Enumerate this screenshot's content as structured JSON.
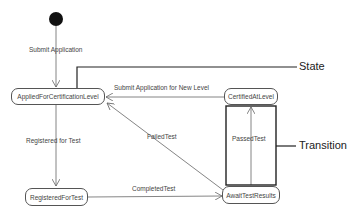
{
  "diagram": {
    "type": "UML state machine",
    "initial_state": "initial-node",
    "states": [
      {
        "id": "applied",
        "label": "AppliedForCertificationLevel"
      },
      {
        "id": "certified",
        "label": "CertifiedAtLevel"
      },
      {
        "id": "registered",
        "label": "RegisteredForTest"
      },
      {
        "id": "await",
        "label": "AwaitTestResults"
      }
    ],
    "transitions": [
      {
        "from": "initial",
        "to": "applied",
        "label": "Submit Application"
      },
      {
        "from": "certified",
        "to": "applied",
        "label": "Submit Application for New Level"
      },
      {
        "from": "applied",
        "to": "registered",
        "label": "Registered for Test"
      },
      {
        "from": "await",
        "to": "applied",
        "label": "FailedTest"
      },
      {
        "from": "registered",
        "to": "await",
        "label": "CompletedTest"
      },
      {
        "from": "await",
        "to": "certified",
        "label": "PassedTest"
      }
    ],
    "callouts": {
      "state": "State",
      "transition": "Transition"
    },
    "colors": {
      "line": "#666666",
      "callout_line": "#222222",
      "text": "#444444"
    }
  }
}
